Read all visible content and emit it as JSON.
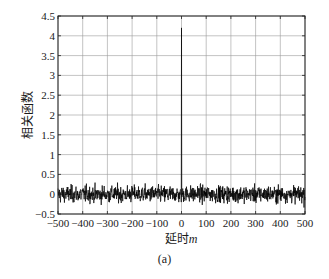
{
  "chart_data": {
    "type": "line",
    "title": "",
    "xlabel": "延时m",
    "xlabel_main": "延时",
    "xlabel_var": "m",
    "ylabel": "相关函数",
    "xlim": [
      -500,
      500
    ],
    "ylim": [
      -0.5,
      4.5
    ],
    "xticks": [
      -500,
      -400,
      -300,
      -200,
      -100,
      0,
      100,
      200,
      300,
      400,
      500
    ],
    "xtick_labels": [
      "−500",
      "−400",
      "−300",
      "−200",
      "−100",
      "0",
      "100",
      "200",
      "300",
      "400",
      "500"
    ],
    "yticks": [
      -0.5,
      0,
      0.5,
      1,
      1.5,
      2,
      2.5,
      3,
      3.5,
      4,
      4.5
    ],
    "ytick_labels": [
      "−0.5",
      "0",
      "0.5",
      "1",
      "1.5",
      "2",
      "2.5",
      "3",
      "3.5",
      "4",
      "4.5"
    ],
    "grid": true,
    "legend": null,
    "series": [
      {
        "name": "autocorrelation",
        "description": "Noise-like autocorrelation with a single peak at lag 0",
        "peak": {
          "x": 0,
          "y": 4.2
        },
        "noise_band": [
          -0.4,
          0.4
        ],
        "noise_typical_amplitude": 0.15,
        "color": "#000000"
      }
    ]
  },
  "caption": "(a)"
}
